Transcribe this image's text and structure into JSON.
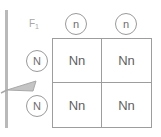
{
  "diagram": {
    "type": "punnett-square",
    "generation_label": {
      "text": "F",
      "subscript": "1"
    },
    "top_alleles": [
      "n",
      "n"
    ],
    "left_alleles": [
      "N",
      "N"
    ],
    "cells": [
      [
        "Nn",
        "Nn"
      ],
      [
        "Nn",
        "Nn"
      ]
    ],
    "annotation_arrow": {
      "name": "left-pointing-arrow",
      "direction": "left"
    },
    "colors": {
      "grid_stroke": "#9d9d9d",
      "circle_stroke": "#9a9a9a",
      "cell_text": "#5f5f5f",
      "allele_text": "#6e6e6e",
      "label_text": "#a8a8a8",
      "rail": "#b9b9b9",
      "background": "#ffffff"
    }
  }
}
